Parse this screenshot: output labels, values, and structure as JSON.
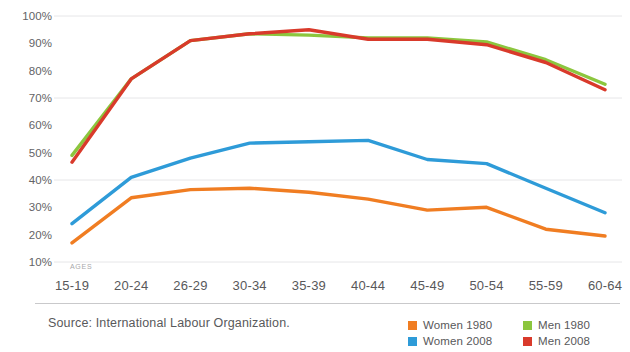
{
  "source_note": "Source: International Labour Organization.",
  "axis": {
    "ages_caption": "AGES"
  },
  "legend": {
    "items": [
      {
        "label": "Women 1980",
        "color": "#f07d22",
        "key": "women_1980"
      },
      {
        "label": "Men 1980",
        "color": "#8cc63e",
        "key": "men_1980"
      },
      {
        "label": "Women 2008",
        "color": "#2e9bd8",
        "key": "women_2008"
      },
      {
        "label": "Men 2008",
        "color": "#d93a2b",
        "key": "men_2008"
      }
    ]
  },
  "chart_data": {
    "type": "line",
    "title": "",
    "subtitle": "",
    "xlabel": "AGES",
    "ylabel": "",
    "grid": true,
    "legend_position": "bottom-right",
    "categories": [
      "15-19",
      "20-24",
      "26-29",
      "30-34",
      "35-39",
      "40-44",
      "45-49",
      "50-54",
      "55-59",
      "60-64"
    ],
    "ytick_labels": [
      "100%",
      "90%",
      "80%",
      "70%",
      "60%",
      "50%",
      "40%",
      "30%",
      "20%",
      "10%"
    ],
    "ytick_values": [
      100,
      90,
      80,
      70,
      60,
      50,
      40,
      30,
      20,
      10
    ],
    "ylim": [
      5,
      102
    ],
    "yunit": "%",
    "gridline_values": [
      100,
      70,
      40,
      10
    ],
    "series": [
      {
        "name": "Women 1980",
        "color": "#f07d22",
        "values": [
          17,
          33.5,
          36.5,
          37,
          35.5,
          33,
          29,
          30,
          22,
          19.5
        ]
      },
      {
        "name": "Men 1980",
        "color": "#8cc63e",
        "values": [
          49,
          77,
          91,
          93.5,
          93,
          92,
          92,
          90.5,
          84,
          75
        ]
      },
      {
        "name": "Women 2008",
        "color": "#2e9bd8",
        "values": [
          24,
          41,
          48,
          53.5,
          54,
          54.5,
          47.5,
          46,
          37,
          28
        ]
      },
      {
        "name": "Men 2008",
        "color": "#d93a2b",
        "values": [
          46.5,
          77,
          91,
          93.5,
          95,
          91.5,
          91.5,
          89.5,
          83,
          73
        ]
      }
    ]
  }
}
